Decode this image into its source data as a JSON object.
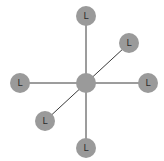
{
  "diagram": {
    "type": "star-graph",
    "node_radius": 10,
    "node_color": "#9a9a9a",
    "edge_color": "#3a3a3a",
    "nodes": [
      {
        "id": "center",
        "label": "",
        "x": 86,
        "y": 83
      },
      {
        "id": "top",
        "label": "L",
        "x": 86,
        "y": 16
      },
      {
        "id": "upper-right",
        "label": "L",
        "x": 129,
        "y": 43
      },
      {
        "id": "right",
        "label": "L",
        "x": 148,
        "y": 83
      },
      {
        "id": "bottom",
        "label": "L",
        "x": 86,
        "y": 148
      },
      {
        "id": "lower-left",
        "label": "L",
        "x": 45,
        "y": 121
      },
      {
        "id": "left",
        "label": "L",
        "x": 20,
        "y": 83
      }
    ],
    "edges": [
      {
        "from": "top",
        "to": "bottom"
      },
      {
        "from": "left",
        "to": "right"
      },
      {
        "from": "lower-left",
        "to": "upper-right"
      }
    ]
  }
}
